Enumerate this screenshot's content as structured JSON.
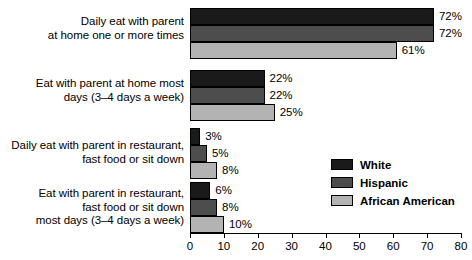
{
  "chart_data": {
    "type": "bar",
    "orientation": "horizontal",
    "title": "",
    "xlabel": "",
    "ylabel": "",
    "xlim": [
      0,
      80
    ],
    "xticks": [
      0,
      10,
      20,
      30,
      40,
      50,
      60,
      70,
      80
    ],
    "xtick_labels": [
      "0",
      "10",
      "20",
      "30",
      "40",
      "50",
      "60",
      "70",
      "80"
    ],
    "grid": false,
    "value_suffix": "%",
    "legend_position": "center-right",
    "categories": [
      "Daily eat with parent\nat home one or more times",
      "Eat with parent at home most\ndays (3–4 days a week)",
      "Daily eat with parent in restaurant,\nfast food or sit down",
      "Eat with parent in restaurant,\nfast food or sit down\nmost days (3–4 days a week)"
    ],
    "series": [
      {
        "name": "White",
        "color": "#1a1a1a",
        "values": [
          72,
          22,
          3,
          6
        ],
        "labels": [
          "72%",
          "22%",
          "3%",
          "6%"
        ]
      },
      {
        "name": "Hispanic",
        "color": "#4d4d4d",
        "values": [
          72,
          22,
          5,
          8
        ],
        "labels": [
          "72%",
          "22%",
          "5%",
          "8%"
        ]
      },
      {
        "name": "African American",
        "color": "#b3b3b3",
        "values": [
          61,
          25,
          8,
          10
        ],
        "labels": [
          "61%",
          "25%",
          "8%",
          "10%"
        ]
      }
    ]
  }
}
